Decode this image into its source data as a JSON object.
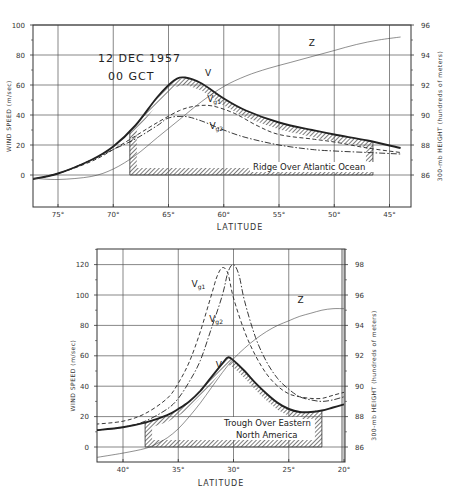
{
  "chart_data": [
    {
      "type": "line",
      "title": "12 DEC 1957 00 GCT",
      "annotation_lines": [
        "12 DEC 1957",
        "00 GCT"
      ],
      "region_label": "Ridge Over Atlantic Ocean",
      "xlabel": "LATITUDE",
      "ylabel": "WIND SPEED (m/sec)",
      "y2label": "300-mb HEIGHT (hundreds of meters)",
      "xlim": [
        77.5,
        44
      ],
      "ylim": [
        -20,
        100
      ],
      "y2lim": [
        84,
        96
      ],
      "x_ticks": [
        75,
        70,
        65,
        60,
        55,
        50,
        45
      ],
      "x_tick_labels": [
        "75°",
        "70°",
        "65°",
        "60°",
        "55°",
        "50°",
        "45°"
      ],
      "y_ticks": [
        0,
        20,
        40,
        60,
        80,
        100
      ],
      "y2_ticks": [
        86,
        88,
        90,
        92,
        94,
        96
      ],
      "grid": true,
      "series": [
        {
          "name": "V",
          "style": "solid-thick",
          "x": [
            77.5,
            75,
            72,
            70,
            68,
            66,
            64.5,
            63.5,
            62,
            60,
            58,
            55,
            52,
            50,
            47,
            44
          ],
          "values": [
            -3,
            1,
            10,
            19,
            33,
            52,
            63,
            65,
            61,
            51,
            43,
            35,
            30,
            27,
            23,
            18
          ]
        },
        {
          "name": "Vg1",
          "style": "dashed",
          "x": [
            77.5,
            75,
            72,
            70,
            68,
            66,
            64,
            62.5,
            61,
            59,
            57,
            55,
            52,
            50,
            47,
            44
          ],
          "values": [
            -3,
            1,
            9,
            17,
            26,
            35,
            43,
            46,
            46,
            41,
            33,
            27,
            24,
            22,
            18,
            15
          ]
        },
        {
          "name": "Vg2",
          "style": "dash-dot",
          "x": [
            77.5,
            75,
            72,
            70,
            68,
            66,
            65,
            63.5,
            62,
            60,
            58,
            55,
            52,
            50,
            47,
            44
          ],
          "values": [
            -3,
            1,
            10,
            17,
            24,
            33,
            38,
            39,
            36,
            30,
            25,
            20,
            17,
            16,
            15,
            14
          ]
        },
        {
          "name": "Z",
          "style": "thin",
          "axis": "y2",
          "x": [
            77.5,
            75,
            72,
            70,
            68,
            66,
            64,
            62,
            60,
            58,
            56,
            54,
            52,
            50,
            48,
            46,
            44
          ],
          "values": [
            85.8,
            85.7,
            85.9,
            86.4,
            87.3,
            88.5,
            89.7,
            90.9,
            91.9,
            92.6,
            93.1,
            93.5,
            93.9,
            94.3,
            94.7,
            95.0,
            95.2
          ]
        }
      ],
      "labels": [
        {
          "text": "V",
          "x": 61.7,
          "y": 66
        },
        {
          "text": "Vg1",
          "x": 61.5,
          "y": 49
        },
        {
          "text": "Vg2",
          "x": 61.3,
          "y": 31
        },
        {
          "text": "Z",
          "x": 52.3,
          "y2": 94.6
        }
      ],
      "hatched_region": {
        "x_start": 68.5,
        "x_end": 46.5,
        "y_top_follows": "V",
        "y_base": 0
      }
    },
    {
      "type": "line",
      "title": "Trough Over Eastern North America",
      "region_label_lines": [
        "Trough Over Eastern",
        "North America"
      ],
      "xlabel": "LATITUDE",
      "ylabel": "WIND SPEED (m/sec)",
      "y2label": "300-mb HEIGHT (hundreds of meters)",
      "xlim": [
        42.5,
        20
      ],
      "ylim": [
        -10,
        130
      ],
      "y2lim": [
        85,
        99
      ],
      "x_ticks": [
        40,
        35,
        30,
        25,
        20
      ],
      "x_tick_labels": [
        "40°",
        "35°",
        "30°",
        "25°",
        "20°"
      ],
      "y_ticks": [
        0,
        20,
        40,
        60,
        80,
        100,
        120
      ],
      "y2_ticks": [
        86,
        88,
        90,
        92,
        94,
        96,
        98
      ],
      "grid": true,
      "series": [
        {
          "name": "V",
          "style": "solid-thick",
          "x": [
            42.5,
            40,
            38,
            36,
            35,
            34,
            33,
            32,
            31,
            30.5,
            30,
            29,
            28,
            27,
            26,
            25,
            24,
            23,
            22,
            21,
            20
          ],
          "values": [
            11,
            13,
            16,
            21,
            25,
            30,
            37,
            46,
            55,
            59,
            57,
            50,
            42,
            35,
            29,
            25,
            23,
            23,
            24,
            26,
            28
          ]
        },
        {
          "name": "Vg1",
          "style": "dashed",
          "x": [
            42.5,
            40,
            38,
            36,
            35,
            34,
            33,
            32,
            31.5,
            31,
            30.5,
            30,
            29,
            28,
            27,
            26,
            25,
            24,
            23,
            22,
            21,
            20
          ],
          "values": [
            15,
            17,
            22,
            32,
            42,
            56,
            76,
            100,
            112,
            118,
            114,
            98,
            76,
            60,
            48,
            40,
            35,
            33,
            32,
            32,
            34,
            36
          ]
        },
        {
          "name": "Vg2",
          "style": "dash-dot",
          "x": [
            42.5,
            40,
            38,
            36,
            35,
            34,
            33,
            32,
            31,
            30.5,
            30,
            29.5,
            29,
            28,
            27,
            26,
            25,
            24,
            23,
            22,
            21,
            20
          ],
          "values": [
            11,
            13,
            17,
            25,
            32,
            43,
            57,
            78,
            100,
            115,
            120,
            113,
            96,
            72,
            56,
            45,
            38,
            33,
            31,
            30,
            31,
            33
          ]
        },
        {
          "name": "Z",
          "style": "thin",
          "axis": "y2",
          "x": [
            42.5,
            40,
            38,
            37,
            36,
            35,
            34,
            33,
            32,
            31,
            30,
            29,
            28,
            27,
            26,
            25,
            24,
            23,
            22,
            21,
            20
          ],
          "values": [
            85.3,
            85.6,
            85.9,
            86.2,
            86.6,
            87.2,
            88.0,
            88.9,
            89.9,
            90.9,
            91.8,
            92.5,
            93.1,
            93.6,
            94.0,
            94.3,
            94.6,
            94.8,
            95.0,
            95.1,
            95.1
          ]
        }
      ],
      "labels": [
        {
          "text": "Vg1",
          "x": 33.8,
          "y": 105
        },
        {
          "text": "Vg2",
          "x": 32.2,
          "y": 82
        },
        {
          "text": "V",
          "x": 31.6,
          "y": 52
        },
        {
          "text": "Z",
          "x": 24.2,
          "y2": 95.5
        }
      ],
      "hatched_region": {
        "x_start": 38,
        "x_end": 22,
        "y_top_follows": "V",
        "y_base": 0
      }
    }
  ],
  "layout": {
    "charts": [
      {
        "left": 33,
        "right": 411,
        "top": 25,
        "bottom": 207,
        "y_px_per_unit": 1.5,
        "y_zero_px": 175,
        "x_px_per_deg": 11.05,
        "x_ref_deg": 75,
        "x_ref_px": 58,
        "y2_ref_val": 86,
        "y2_ref_px": 175,
        "y2_px_per_unit": 15,
        "xlabel_y": 230,
        "annotation_x": 98,
        "annotation_y1": 62,
        "annotation_y2": 80,
        "region_label_x": 253,
        "region_label_y": 170
      },
      {
        "left": 97,
        "right": 345,
        "top": 249,
        "bottom": 462,
        "y_px_per_unit": 1.52,
        "y_zero_px": 447,
        "x_px_per_deg": 11.05,
        "x_ref_deg": 40,
        "x_ref_px": 123,
        "y2_ref_val": 86,
        "y2_ref_px": 447,
        "y2_px_per_unit": 15.2,
        "xlabel_y": 486,
        "region_label_x": 248,
        "region_label_y1": 426,
        "region_label_y2": 436
      }
    ],
    "ink": "#222222",
    "hatch": "#555555"
  }
}
